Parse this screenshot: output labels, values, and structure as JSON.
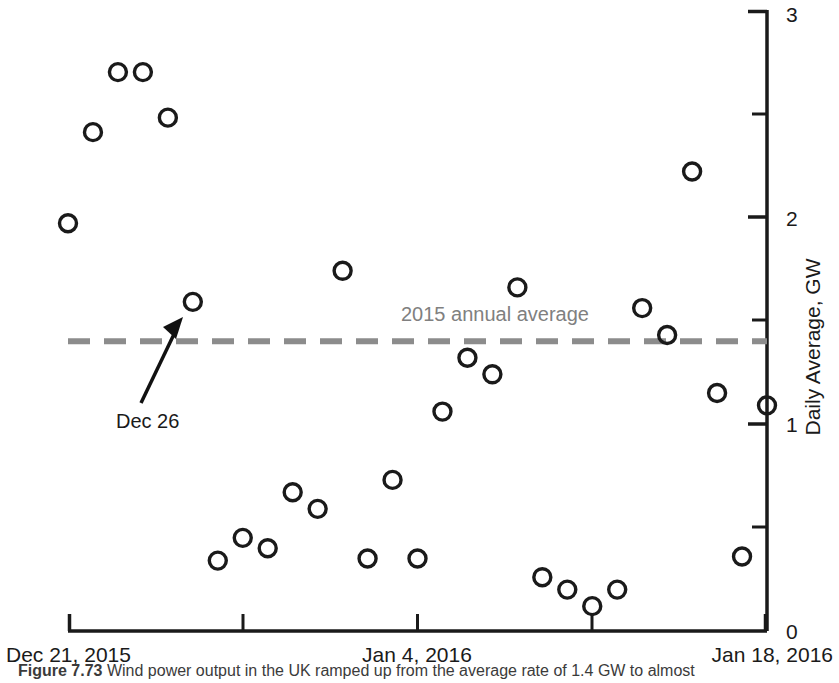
{
  "chart_data": {
    "type": "scatter",
    "title": "",
    "xlabel": "",
    "ylabel": "Daily Average, GW",
    "xlim": [
      "Dec 21, 2015",
      "Jan 18, 2016"
    ],
    "ylim": [
      0,
      3
    ],
    "y_ticks": [
      0,
      0.5,
      1,
      1.5,
      2,
      2.5,
      3
    ],
    "y_tick_labels": [
      "0",
      "",
      "1",
      "",
      "2",
      "",
      "3"
    ],
    "x_tick_labels": [
      "Dec 21, 2015",
      "",
      "Jan 4, 2016",
      "",
      "Jan 18, 2016"
    ],
    "x_tick_days": [
      0,
      7,
      14,
      21,
      28
    ],
    "grid": false,
    "legend": false,
    "marker": "open-circle",
    "points": [
      {
        "day": 0,
        "date": "Dec 21, 2015",
        "value": 1.97
      },
      {
        "day": 1,
        "date": "Dec 22, 2015",
        "value": 2.41
      },
      {
        "day": 2,
        "date": "Dec 23, 2015",
        "value": 2.7
      },
      {
        "day": 3,
        "date": "Dec 24, 2015",
        "value": 2.7
      },
      {
        "day": 4,
        "date": "Dec 25, 2015",
        "value": 2.48
      },
      {
        "day": 5,
        "date": "Dec 26, 2015",
        "value": 1.59
      },
      {
        "day": 6,
        "date": "Dec 27, 2015",
        "value": 0.34
      },
      {
        "day": 7,
        "date": "Dec 28, 2015",
        "value": 0.45
      },
      {
        "day": 8,
        "date": "Dec 29, 2015",
        "value": 0.4
      },
      {
        "day": 9,
        "date": "Dec 30, 2015",
        "value": 0.67
      },
      {
        "day": 10,
        "date": "Dec 31, 2015",
        "value": 0.59
      },
      {
        "day": 11,
        "date": "Jan 1, 2016",
        "value": 1.74
      },
      {
        "day": 12,
        "date": "Jan 2, 2016",
        "value": 0.35
      },
      {
        "day": 13,
        "date": "Jan 3, 2016",
        "value": 0.73
      },
      {
        "day": 14,
        "date": "Jan 4, 2016",
        "value": 0.35
      },
      {
        "day": 15,
        "date": "Jan 5, 2016",
        "value": 1.06
      },
      {
        "day": 16,
        "date": "Jan 6, 2016",
        "value": 1.32
      },
      {
        "day": 17,
        "date": "Jan 7, 2016",
        "value": 1.24
      },
      {
        "day": 18,
        "date": "Jan 8, 2016",
        "value": 1.66
      },
      {
        "day": 19,
        "date": "Jan 9, 2016",
        "value": 0.26
      },
      {
        "day": 20,
        "date": "Jan 10, 2016",
        "value": 0.2
      },
      {
        "day": 21,
        "date": "Jan 11, 2016",
        "value": 0.12
      },
      {
        "day": 22,
        "date": "Jan 12, 2016",
        "value": 0.2
      },
      {
        "day": 23,
        "date": "Jan 13, 2016",
        "value": 1.56
      },
      {
        "day": 24,
        "date": "Jan 14, 2016",
        "value": 1.43
      },
      {
        "day": 25,
        "date": "Jan 15, 2016",
        "value": 2.22
      },
      {
        "day": 26,
        "date": "Jan 16, 2016",
        "value": 1.15
      },
      {
        "day": 27,
        "date": "Jan 17, 2016",
        "value": 0.36
      },
      {
        "day": 28,
        "date": "Jan 18, 2016",
        "value": 1.09
      }
    ],
    "reference_line": {
      "label": "2015 annual average",
      "value": 1.4,
      "style": "dashed",
      "color": "#8c8c8c"
    },
    "annotations": [
      {
        "label": "Dec 26",
        "points_to_day": 5,
        "points_to_value": 1.5
      }
    ]
  },
  "axes": {
    "y_title": "Daily Average, GW",
    "y_label_top": "3",
    "y_label_2": "2",
    "y_label_1": "1",
    "y_label_0": "0",
    "x_label_left": "Dec 21, 2015",
    "x_label_mid": "Jan 4, 2016",
    "x_label_right": "Jan 18, 2016"
  },
  "annotation_text": {
    "average_line": "2015 annual average",
    "callout": "Dec 26"
  },
  "caption": {
    "figure_number": "Figure 7.73",
    "text": "Wind power output in the UK ramped up from the average rate of 1.4 GW to almost"
  },
  "colors": {
    "axis": "#1a1a1a",
    "marker_stroke": "#1a1a1a",
    "reference_line": "#8c8c8c",
    "annotation_text": "#808080"
  }
}
